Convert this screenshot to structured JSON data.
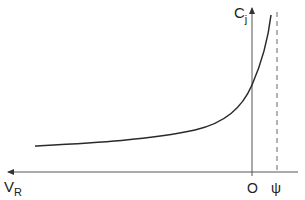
{
  "diagram": {
    "labels": {
      "y_axis": "C",
      "y_axis_sub": "j",
      "x_axis": "V",
      "x_axis_sub": "R",
      "origin": "O",
      "psi": "ψ"
    },
    "colors": {
      "line": "#2a2a2a",
      "axis": "#555555",
      "background": "#ffffff"
    },
    "elements": {
      "curve": "Cj rising sharply as voltage approaches ψ",
      "asymptote": "dashed vertical line at ψ"
    }
  }
}
